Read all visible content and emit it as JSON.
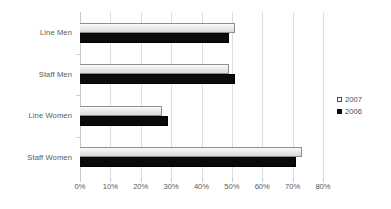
{
  "chart_data": {
    "type": "bar",
    "orientation": "horizontal",
    "title": "",
    "xlabel": "",
    "ylabel": "",
    "categories": [
      "Line Men",
      "Staff Men",
      "Line Women",
      "Staff Women"
    ],
    "series": [
      {
        "name": "2007",
        "values": [
          51,
          49,
          27,
          73
        ],
        "marker": "open-square",
        "color": "#e8e8e8"
      },
      {
        "name": "2006",
        "values": [
          49,
          51,
          29,
          71
        ],
        "marker": "filled-square",
        "color": "#0a0a0a"
      }
    ],
    "xlim": [
      0,
      80
    ],
    "xticks": [
      0,
      10,
      20,
      30,
      40,
      50,
      60,
      70,
      80
    ],
    "xtick_labels": [
      "0%",
      "10%",
      "20%",
      "30%",
      "40%",
      "50%",
      "60%",
      "70%",
      "80%"
    ],
    "grid": true,
    "grid_axis": "x",
    "legend_position": "right",
    "value_unit": "%"
  },
  "legend": {
    "items": [
      {
        "label": "2007",
        "marker": "open-square"
      },
      {
        "label": "2006",
        "marker": "filled-square"
      }
    ]
  },
  "colors": {
    "series_2007": "#e8e8e8",
    "series_2006": "#0a0a0a",
    "gridline": "#dedede",
    "axis": "#c9c9c9",
    "text": "#595959"
  }
}
